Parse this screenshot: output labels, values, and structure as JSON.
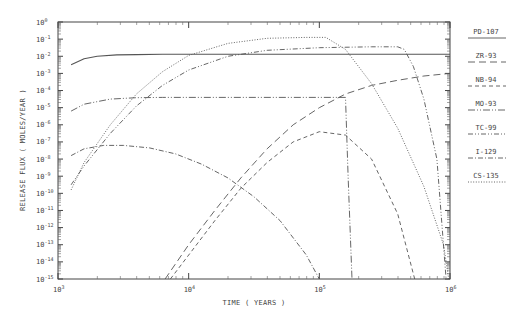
{
  "chart_data": {
    "type": "line",
    "title": "",
    "xlabel": "TIME ( YEARS )",
    "ylabel": "RELEASE FLUX ( MOLES/YEAR )",
    "xscale": "log",
    "yscale": "log",
    "xlim": [
      1000,
      1000000
    ],
    "ylim": [
      1e-15,
      1
    ],
    "grid": false,
    "legend_position": "right",
    "x_tick_labels": [
      "10^3",
      "10^4",
      "10^5",
      "10^6"
    ],
    "y_tick_labels": [
      "10^0",
      "10^-1",
      "10^-2",
      "10^-3",
      "10^-4",
      "10^-5",
      "10^-6",
      "10^-7",
      "10^-8",
      "10^-9",
      "10^-10",
      "10^-11",
      "10^-12",
      "10^-13",
      "10^-14",
      "10^-15"
    ],
    "series": [
      {
        "name": "PD-107",
        "style": "solid",
        "x_log": [
          3.1,
          3.2,
          3.3,
          3.45,
          3.6,
          3.8,
          4.0,
          4.5,
          5.0,
          5.5,
          6.0
        ],
        "y_log": [
          -2.5,
          -2.15,
          -2.0,
          -1.92,
          -1.9,
          -1.88,
          -1.88,
          -1.88,
          -1.88,
          -1.88,
          -1.88
        ]
      },
      {
        "name": "ZR-93",
        "style": "longdash",
        "x_log": [
          3.82,
          4.0,
          4.2,
          4.4,
          4.6,
          4.8,
          5.0,
          5.2,
          5.4,
          5.6,
          5.8,
          6.0
        ],
        "y_log": [
          -15,
          -13.0,
          -11.0,
          -9.1,
          -7.4,
          -6.0,
          -5.0,
          -4.2,
          -3.7,
          -3.4,
          -3.15,
          -3.0
        ]
      },
      {
        "name": "NB-94",
        "style": "dash",
        "x_log": [
          3.86,
          4.0,
          4.2,
          4.4,
          4.6,
          4.8,
          5.0,
          5.2,
          5.4,
          5.6,
          5.73
        ],
        "y_log": [
          -15,
          -13.6,
          -11.6,
          -9.7,
          -8.2,
          -7.0,
          -6.4,
          -6.6,
          -8.0,
          -11.2,
          -15
        ]
      },
      {
        "name": "MO-93",
        "style": "dashdotdot-long",
        "x_log": [
          3.1,
          3.2,
          3.4,
          3.6,
          3.8,
          4.0,
          4.5,
          5.0,
          5.15,
          5.2,
          5.22,
          5.25
        ],
        "y_log": [
          -5.2,
          -4.8,
          -4.5,
          -4.42,
          -4.4,
          -4.4,
          -4.4,
          -4.4,
          -4.4,
          -4.4,
          -9.0,
          -15
        ]
      },
      {
        "name": "TC-99",
        "style": "dashdotdot",
        "x_log": [
          3.1,
          3.2,
          3.4,
          3.6,
          3.8,
          4.0,
          4.3,
          4.6,
          5.0,
          5.4,
          5.6,
          5.65,
          5.72,
          5.8,
          5.9,
          5.97
        ],
        "y_log": [
          -9.5,
          -8.4,
          -6.5,
          -4.9,
          -3.7,
          -2.8,
          -2.0,
          -1.65,
          -1.5,
          -1.45,
          -1.45,
          -1.6,
          -2.6,
          -4.5,
          -8.0,
          -15
        ]
      },
      {
        "name": "I-129",
        "style": "dashdot",
        "x_log": [
          3.1,
          3.2,
          3.35,
          3.5,
          3.7,
          3.9,
          4.1,
          4.3,
          4.5,
          4.7,
          4.9,
          5.0
        ],
        "y_log": [
          -7.8,
          -7.4,
          -7.2,
          -7.2,
          -7.35,
          -7.7,
          -8.3,
          -9.1,
          -10.2,
          -11.6,
          -13.6,
          -15
        ]
      },
      {
        "name": "CS-135",
        "style": "dotted",
        "x_log": [
          3.1,
          3.2,
          3.4,
          3.6,
          3.8,
          4.0,
          4.3,
          4.6,
          4.9,
          5.05,
          5.2,
          5.4,
          5.6,
          5.8,
          5.95,
          5.99
        ],
        "y_log": [
          -9.8,
          -8.2,
          -6.0,
          -4.2,
          -2.9,
          -1.95,
          -1.25,
          -0.95,
          -0.9,
          -0.9,
          -1.6,
          -3.6,
          -6.2,
          -9.6,
          -13.0,
          -15
        ]
      }
    ]
  },
  "axes": {
    "xlabel": "TIME ( YEARS )",
    "ylabel": "RELEASE FLUX ( MOLES/YEAR )"
  },
  "legend": {
    "items": [
      {
        "label": "PD-107",
        "style": "solid"
      },
      {
        "label": "ZR-93",
        "style": "longdash"
      },
      {
        "label": "NB-94",
        "style": "dash"
      },
      {
        "label": "MO-93",
        "style": "dashdotdot-long"
      },
      {
        "label": "TC-99",
        "style": "dashdotdot"
      },
      {
        "label": "I-129",
        "style": "dashdot"
      },
      {
        "label": "CS-135",
        "style": "dotted"
      }
    ]
  }
}
